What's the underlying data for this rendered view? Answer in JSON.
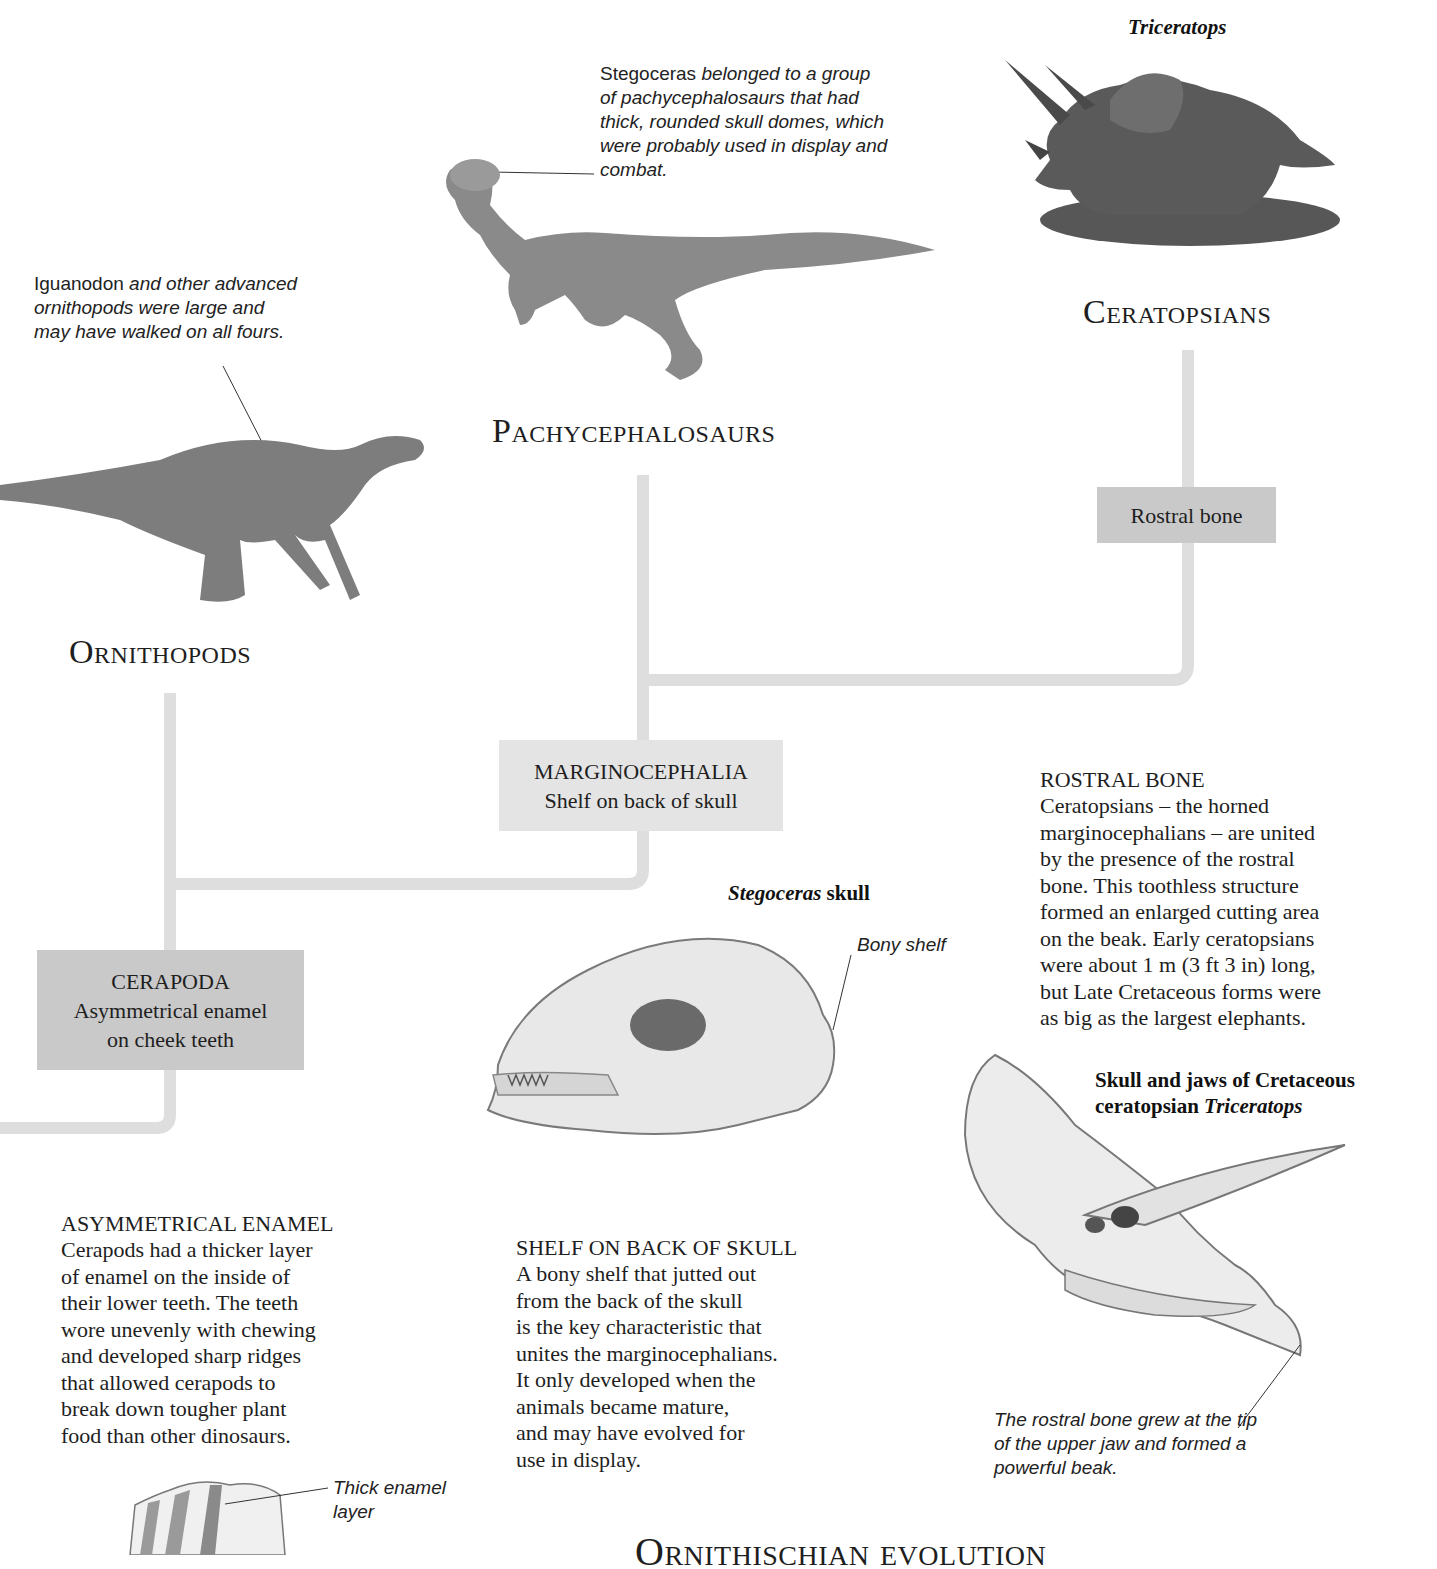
{
  "page": {
    "footer_title": "Ornithischian evolution"
  },
  "groups": {
    "ceratopsians": {
      "title": "Ceratopsians",
      "illustration_caption": "Triceratops",
      "node_label": "Rostral bone"
    },
    "pachycephalosaurs": {
      "title": "Pachycephalosaurs",
      "annotation_name": "Stegoceras",
      "annotation_text": " belonged to a group of pachycephalosaurs that had thick, rounded skull domes, which were probably used in display and combat."
    },
    "ornithopods": {
      "title": "Ornithopods",
      "annotation_name": "Iguanodon",
      "annotation_text": " and other advanced ornithopods were large and may have walked on all fours."
    }
  },
  "nodes": {
    "marginocephalia": {
      "name": "MARGINOCEPHALIA",
      "trait": "Shelf on back of skull"
    },
    "cerapoda": {
      "name": "CERAPODA",
      "trait_line1": "Asymmetrical enamel",
      "trait_line2": "on cheek teeth"
    }
  },
  "descriptions": {
    "rostral_bone": {
      "heading": "ROSTRAL BONE",
      "text": "Ceratopsians – the horned\nmarginocephalians – are united\nby the presence of the rostral\nbone. This toothless structure\nformed an enlarged cutting area\non the beak. Early ceratopsians\nwere about 1 m (3 ft 3 in) long,\nbut Late Cretaceous forms were\nas big as the largest elephants."
    },
    "shelf": {
      "heading": "SHELF ON BACK OF SKULL",
      "text": "A bony shelf that jutted out\nfrom the back of the skull\nis the key characteristic that\nunites the marginocephalians.\nIt only developed when the\nanimals became mature,\nand may have evolved for\nuse in display."
    },
    "enamel": {
      "heading": "ASYMMETRICAL ENAMEL",
      "text": "Cerapods had a thicker layer\nof enamel on the inside of\ntheir lower teeth. The teeth\nwore unevenly with chewing\nand developed sharp ridges\nthat allowed cerapods to\nbreak down tougher plant\nfood than other dinosaurs."
    }
  },
  "figures": {
    "stegoceras_skull": {
      "title_italic": "Stegoceras",
      "title_rest": " skull",
      "label": "Bony shelf"
    },
    "triceratops_skull": {
      "title_line1": "Skull and jaws of Cretaceous",
      "title_line2_plain": "ceratopsian ",
      "title_line2_italic": "Triceratops",
      "caption": "The rostral bone grew at the tip of the upper jaw and formed a powerful beak."
    },
    "tooth": {
      "label_line1": "Thick enamel",
      "label_line2": "layer"
    }
  },
  "colors": {
    "tree_line": "#dedede",
    "node_dark": "#c9c9c9",
    "node_light": "#e4e4e4",
    "text": "#1e1e1e"
  }
}
